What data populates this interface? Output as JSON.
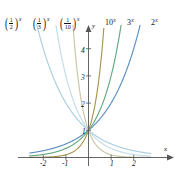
{
  "figure": {
    "title": "",
    "background": "#ffffff"
  },
  "axes": {
    "x_axis_label": "x",
    "y_axis_label": "y",
    "x_ticks": [
      "-2",
      "-1",
      "1",
      "2"
    ],
    "x_tick_values": [
      -2,
      -1,
      1,
      2
    ],
    "y_ticks": [
      "1",
      "2",
      "3",
      "4"
    ],
    "y_tick_values": [
      1,
      2,
      3,
      4
    ],
    "xlim": [
      -2.6,
      2.75
    ],
    "ylim": [
      -0.35,
      4.9
    ],
    "grid": false
  },
  "curve_labels": {
    "half": {
      "num": "1",
      "den": "2",
      "exponent": "x"
    },
    "third": {
      "num": "1",
      "den": "3",
      "exponent": "x"
    },
    "tenth": {
      "num": "1",
      "den": "10",
      "exponent": "x"
    },
    "ten": {
      "base": "10",
      "exponent": "x"
    },
    "three": {
      "base": "3",
      "exponent": "x"
    },
    "two": {
      "base": "2",
      "exponent": "x"
    }
  },
  "colors": {
    "two": "#5b8fc4",
    "three": "#63a880",
    "ten": "#a99452",
    "half": "#a8cfe0",
    "third": "#c3dce8",
    "tenth": "#c8c7a4",
    "axis": "#555555",
    "text": "#141414"
  },
  "chart_data": {
    "type": "line",
    "xlabel": "x",
    "ylabel": "y",
    "xlim": [
      -2.6,
      2.75
    ],
    "ylim": [
      -0.35,
      4.9
    ],
    "grid": false,
    "legend": "inline-curve-labels",
    "x_ticks": [
      -2,
      -1,
      1,
      2
    ],
    "y_ticks": [
      1,
      2,
      3,
      4
    ],
    "series": [
      {
        "name": "2^x",
        "base": 2,
        "color": "#5b8fc4",
        "label_position": "top-right",
        "x": [
          -2.6,
          -2,
          -1.5,
          -1,
          -0.5,
          0,
          0.5,
          1,
          1.5,
          2,
          2.3
        ],
        "values": [
          0.165,
          0.25,
          0.354,
          0.5,
          0.707,
          1,
          1.414,
          2,
          2.828,
          4,
          4.925
        ]
      },
      {
        "name": "3^x",
        "base": 3,
        "color": "#63a880",
        "label_position": "top-right",
        "x": [
          -2.6,
          -2,
          -1.5,
          -1,
          -0.5,
          0,
          0.5,
          1,
          1.25,
          1.45
        ],
        "values": [
          0.077,
          0.111,
          0.192,
          0.333,
          0.577,
          1,
          1.732,
          3,
          3.948,
          4.92
        ]
      },
      {
        "name": "10^x",
        "base": 10,
        "color": "#a99452",
        "label_position": "top-right",
        "x": [
          -2.6,
          -2,
          -1.5,
          -1,
          -0.5,
          0,
          0.25,
          0.5,
          0.69
        ],
        "values": [
          0.0025,
          0.01,
          0.032,
          0.1,
          0.316,
          1,
          1.778,
          3.162,
          4.9
        ]
      },
      {
        "name": "(1/2)^x",
        "base": 0.5,
        "color": "#a8cfe0",
        "label_position": "top-left",
        "x": [
          -2.3,
          -2,
          -1.5,
          -1,
          -0.5,
          0,
          0.5,
          1,
          1.5,
          2,
          2.6
        ],
        "values": [
          4.925,
          4,
          2.828,
          2,
          1.414,
          1,
          0.707,
          0.5,
          0.354,
          0.25,
          0.165
        ]
      },
      {
        "name": "(1/3)^x",
        "base": 0.3333,
        "color": "#c3dce8",
        "label_position": "top-left",
        "x": [
          -1.45,
          -1.25,
          -1,
          -0.5,
          0,
          0.5,
          1,
          1.5,
          2,
          2.6
        ],
        "values": [
          4.92,
          3.948,
          3,
          1.732,
          1,
          0.577,
          0.333,
          0.192,
          0.111,
          0.077
        ]
      },
      {
        "name": "(1/10)^x",
        "base": 0.1,
        "color": "#c8c7a4",
        "label_position": "top-left",
        "x": [
          -0.69,
          -0.5,
          -0.25,
          0,
          0.5,
          1,
          1.5,
          2,
          2.6
        ],
        "values": [
          4.9,
          3.162,
          1.778,
          1,
          0.316,
          0.1,
          0.032,
          0.01,
          0.0025
        ]
      }
    ]
  }
}
